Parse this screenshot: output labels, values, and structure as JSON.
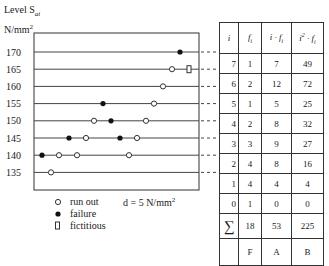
{
  "header": {
    "level_label": "Level S",
    "level_subscript": "ai",
    "unit": "N/mm",
    "unit_sup": "2"
  },
  "legend": {
    "run_out": "run out",
    "failure": "failure",
    "fictitious": "fictitious",
    "step": "d = 5 N/mm",
    "step_sup": "2"
  },
  "chart_data": {
    "type": "scatter",
    "ylabel": "N/mm²",
    "levels": [
      170,
      165,
      160,
      155,
      150,
      145,
      140,
      135
    ],
    "step_d": 5,
    "points": [
      {
        "level": 170,
        "x": 180,
        "kind": "failure"
      },
      {
        "level": 165,
        "x": 172,
        "kind": "run out"
      },
      {
        "level": 165,
        "x": 189,
        "kind": "fictitious"
      },
      {
        "level": 160,
        "x": 163,
        "kind": "run out"
      },
      {
        "level": 155,
        "x": 103,
        "kind": "failure"
      },
      {
        "level": 155,
        "x": 154,
        "kind": "run out"
      },
      {
        "level": 150,
        "x": 94,
        "kind": "run out"
      },
      {
        "level": 150,
        "x": 111,
        "kind": "failure"
      },
      {
        "level": 150,
        "x": 146,
        "kind": "run out"
      },
      {
        "level": 145,
        "x": 69,
        "kind": "failure"
      },
      {
        "level": 145,
        "x": 86,
        "kind": "run out"
      },
      {
        "level": 145,
        "x": 120,
        "kind": "failure"
      },
      {
        "level": 145,
        "x": 137,
        "kind": "run out"
      },
      {
        "level": 140,
        "x": 42,
        "kind": "failure"
      },
      {
        "level": 140,
        "x": 59,
        "kind": "run out"
      },
      {
        "level": 140,
        "x": 77,
        "kind": "run out"
      },
      {
        "level": 140,
        "x": 129,
        "kind": "run out"
      },
      {
        "level": 135,
        "x": 51,
        "kind": "run out"
      }
    ]
  },
  "table": {
    "headers": [
      "i",
      "f_i",
      "i·f_i",
      "i²·f_i"
    ],
    "rows": [
      [
        "7",
        "1",
        "7",
        "49"
      ],
      [
        "6",
        "2",
        "12",
        "72"
      ],
      [
        "5",
        "1",
        "5",
        "25"
      ],
      [
        "4",
        "2",
        "8",
        "32"
      ],
      [
        "3",
        "3",
        "9",
        "27"
      ],
      [
        "2",
        "4",
        "8",
        "16"
      ],
      [
        "1",
        "4",
        "4",
        "4"
      ],
      [
        "0",
        "1",
        "0",
        "0"
      ]
    ],
    "sum": [
      "∑",
      "18",
      "53",
      "225"
    ],
    "labels": [
      "",
      "F",
      "A",
      "B"
    ]
  }
}
